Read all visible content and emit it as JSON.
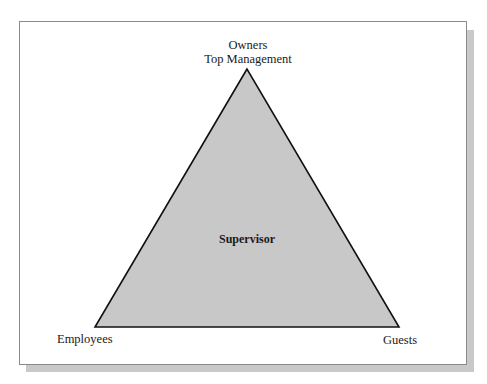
{
  "diagram": {
    "type": "triangle",
    "apex_label_line1": "Owners",
    "apex_label_line2": "Top Management",
    "center_label": "Supervisor",
    "bottom_left_label": "Employees",
    "bottom_right_label": "Guests",
    "colors": {
      "fill": "#c8c8c8",
      "stroke": "#111111",
      "frame_border": "#8a8a8a",
      "shadow": "#c9c9c9"
    }
  }
}
